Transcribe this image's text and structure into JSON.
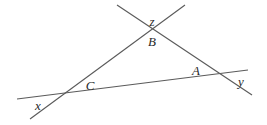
{
  "diagram": {
    "type": "geometry-three-lines-triangle",
    "line_color": "#5a5a5a",
    "label_color": "#2a2a2a",
    "lines": [
      {
        "id": "line-ba",
        "x1": 117,
        "y1": 5,
        "x2": 252,
        "y2": 95
      },
      {
        "id": "line-cb",
        "x1": 30,
        "y1": 119,
        "x2": 185,
        "y2": 5
      },
      {
        "id": "line-ca",
        "x1": 17,
        "y1": 99,
        "x2": 248,
        "y2": 70
      }
    ],
    "vertices": {
      "A": {
        "x": 219,
        "y": 74
      },
      "B": {
        "x": 152,
        "y": 29
      },
      "C": {
        "x": 63,
        "y": 94
      }
    },
    "labels": {
      "z": {
        "text": "z",
        "x": 152,
        "y": 21
      },
      "B": {
        "text": "B",
        "x": 152,
        "y": 41
      },
      "A": {
        "text": "A",
        "x": 196,
        "y": 70
      },
      "y": {
        "text": "y",
        "x": 241,
        "y": 81
      },
      "C": {
        "text": "C",
        "x": 90,
        "y": 85
      },
      "x": {
        "text": "x",
        "x": 38,
        "y": 105
      }
    }
  }
}
